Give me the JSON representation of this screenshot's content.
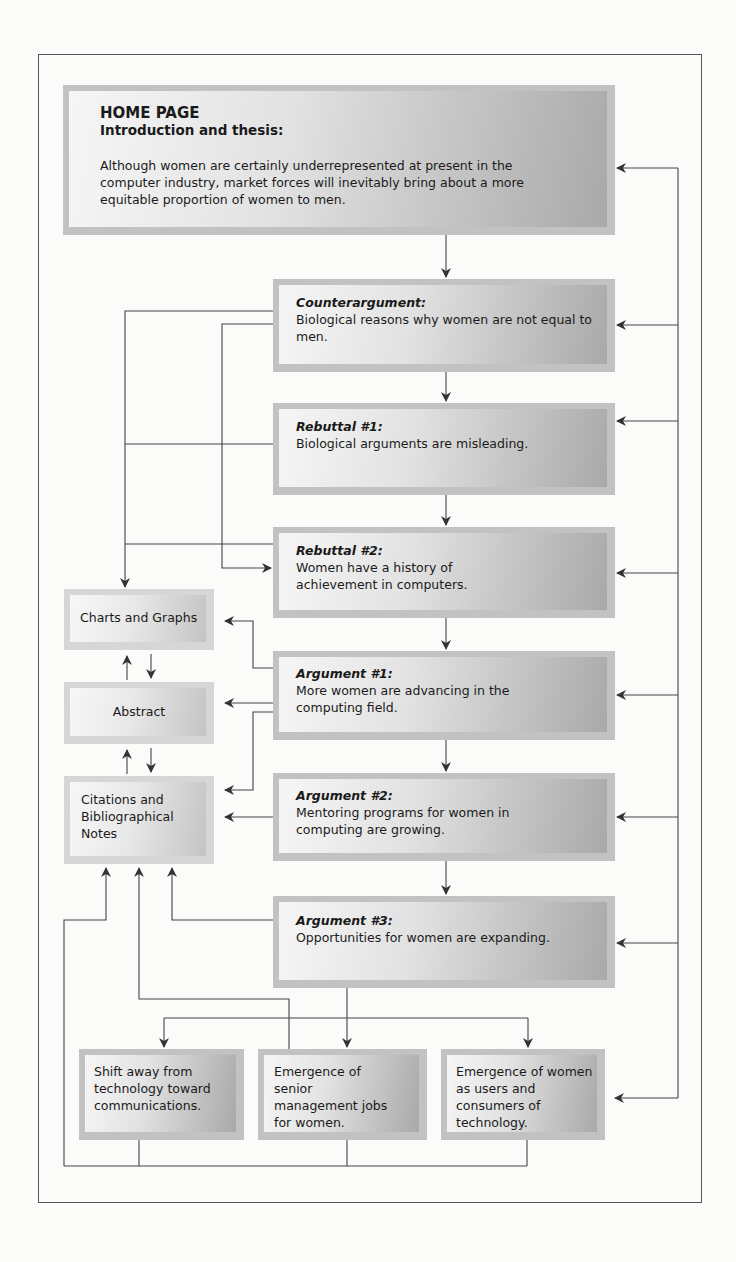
{
  "home": {
    "title": "HOME PAGE",
    "subtitle": "Introduction and thesis:",
    "body": "Although women are certainly underrepresented at present in the computer industry, market forces will inevitably bring about a more equitable proportion of women to men."
  },
  "main_nodes": [
    {
      "heading": "Counterargument:",
      "body": "Biological reasons why women are not equal to men."
    },
    {
      "heading": "Rebuttal #1:",
      "body": "Biological arguments are misleading."
    },
    {
      "heading": "Rebuttal #2:",
      "body": "Women have a history of achievement in computers."
    },
    {
      "heading": "Argument #1:",
      "body": "More women are advancing in the computing field."
    },
    {
      "heading": "Argument #2:",
      "body": "Mentoring programs for women in computing are growing."
    },
    {
      "heading": "Argument #3:",
      "body": "Opportunities for women are expanding."
    }
  ],
  "side_nodes": [
    {
      "label": "Charts and Graphs"
    },
    {
      "label": "Abstract"
    },
    {
      "label": "Citations and Bibliographical Notes"
    }
  ],
  "sub_nodes": [
    {
      "label": "Shift away from technology toward communications."
    },
    {
      "label": "Emergence of senior management jobs for women."
    },
    {
      "label": "Emergence of women as users and consumers of technology."
    }
  ],
  "colors": {
    "line": "#333333",
    "box_frame": "#c2c2c2",
    "box_dark": "#a9a9a9",
    "box_light": "#f6f6f6"
  }
}
